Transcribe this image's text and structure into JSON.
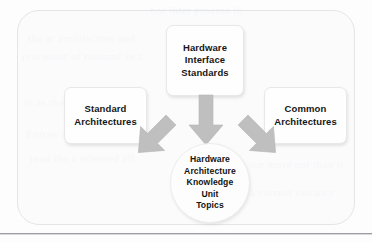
{
  "figure": {
    "type": "block-diagram",
    "container": {
      "shape": "rounded-rectangle"
    },
    "nodes": {
      "top": {
        "label": "Hardware\nInterface\nStandards",
        "shape": "rounded-rectangle"
      },
      "left": {
        "label": "Standard\nArchitectures",
        "shape": "rounded-rectangle"
      },
      "right": {
        "label": "Common\nArchitectures",
        "shape": "rounded-rectangle"
      },
      "center": {
        "label": "Hardware\nArchitecture\nKnowledge\nUnit\nTopics",
        "shape": "circle"
      }
    },
    "arrows": [
      {
        "from": "top",
        "to": "center",
        "direction": "down",
        "color": "#bfbfbf"
      },
      {
        "from": "left",
        "to": "center",
        "direction": "down-right",
        "color": "#bfbfbf"
      },
      {
        "from": "right",
        "to": "center",
        "direction": "down-left",
        "color": "#bfbfbf"
      }
    ],
    "colors": {
      "arrow_fill": "#bfbfbf",
      "node_fill": "#fefefe",
      "node_border": "#e8e8e8",
      "container_border": "#e3e5e8",
      "text": "#161616",
      "page_background": "#fdfdfd",
      "rule": "#9b9da0"
    }
  },
  "scan_artifacts": {
    "bleed_lines": [
      "nor inter process in",
      "the  ar   architecture  and",
      "processor of  tsunaml se a",
      "in as the  re turn ton  the",
      "Entran  at the  a  minutes",
      "read the  a  oriented  all",
      "in our more  not than  it",
      "the  a  current  instance"
    ]
  }
}
